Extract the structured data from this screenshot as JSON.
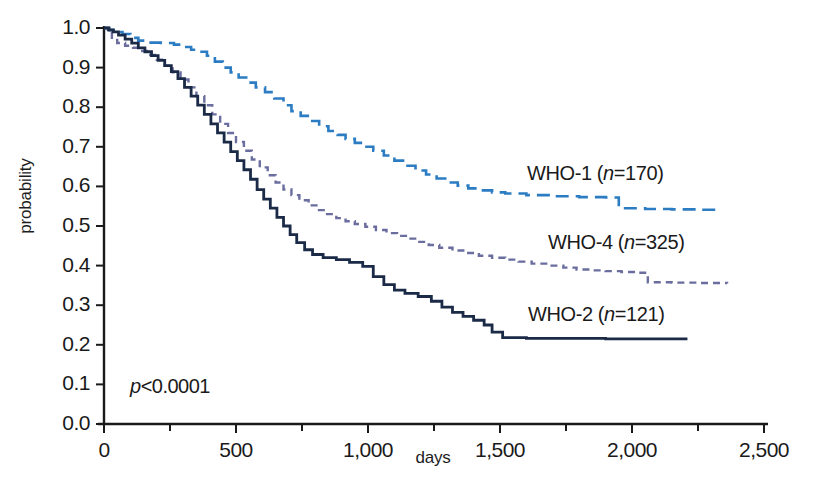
{
  "chart_data": {
    "type": "line",
    "subtype": "kaplan-meier-survival",
    "title": "",
    "xlabel": "days",
    "ylabel": "probability",
    "xlim": [
      0,
      2500
    ],
    "ylim": [
      0.0,
      1.0
    ],
    "grid": false,
    "legend_position": "inline-right",
    "xticks": [
      0,
      500,
      1000,
      1500,
      2000,
      2500
    ],
    "xtick_labels": [
      "0",
      "500",
      "1,000",
      "1,500",
      "2,000",
      "2,500"
    ],
    "xminor_step": 250,
    "yticks": [
      0.0,
      0.1,
      0.2,
      0.3,
      0.4,
      0.5,
      0.6,
      0.7,
      0.8,
      0.9,
      1.0
    ],
    "ytick_labels": [
      "0.0",
      "0.1",
      "0.2",
      "0.3",
      "0.4",
      "0.5",
      "0.6",
      "0.7",
      "0.8",
      "0.9",
      "1.0"
    ],
    "annotations": [
      {
        "name": "p-value",
        "text": "p<0.0001",
        "italic_prefix": "p",
        "rest": "<0.0001",
        "x": 110,
        "y": 0.12
      }
    ],
    "series": [
      {
        "name": "WHO-1",
        "label": "WHO-1",
        "n": 170,
        "legend_text": "WHO-1 (n=170)",
        "color": "#2b7cc2",
        "dash": "dashed",
        "width": 2.6,
        "final_probability": 0.54,
        "final_day": 2330,
        "points": [
          [
            0,
            1.0
          ],
          [
            20,
            0.995
          ],
          [
            45,
            0.99
          ],
          [
            70,
            0.985
          ],
          [
            100,
            0.975
          ],
          [
            130,
            0.968
          ],
          [
            170,
            0.963
          ],
          [
            215,
            0.962
          ],
          [
            265,
            0.958
          ],
          [
            300,
            0.952
          ],
          [
            330,
            0.945
          ],
          [
            360,
            0.94
          ],
          [
            390,
            0.93
          ],
          [
            420,
            0.915
          ],
          [
            450,
            0.9
          ],
          [
            480,
            0.888
          ],
          [
            510,
            0.875
          ],
          [
            545,
            0.862
          ],
          [
            575,
            0.85
          ],
          [
            610,
            0.838
          ],
          [
            645,
            0.822
          ],
          [
            680,
            0.805
          ],
          [
            710,
            0.79
          ],
          [
            745,
            0.778
          ],
          [
            780,
            0.765
          ],
          [
            815,
            0.752
          ],
          [
            850,
            0.74
          ],
          [
            885,
            0.73
          ],
          [
            915,
            0.72
          ],
          [
            950,
            0.71
          ],
          [
            985,
            0.7
          ],
          [
            1020,
            0.69
          ],
          [
            1060,
            0.678
          ],
          [
            1100,
            0.665
          ],
          [
            1140,
            0.652
          ],
          [
            1180,
            0.64
          ],
          [
            1220,
            0.63
          ],
          [
            1260,
            0.62
          ],
          [
            1300,
            0.61
          ],
          [
            1340,
            0.602
          ],
          [
            1380,
            0.595
          ],
          [
            1420,
            0.59
          ],
          [
            1470,
            0.585
          ],
          [
            1520,
            0.582
          ],
          [
            1600,
            0.578
          ],
          [
            1700,
            0.575
          ],
          [
            1800,
            0.573
          ],
          [
            1900,
            0.572
          ],
          [
            1950,
            0.545
          ],
          [
            2050,
            0.543
          ],
          [
            2150,
            0.542
          ],
          [
            2250,
            0.541
          ],
          [
            2330,
            0.54
          ]
        ]
      },
      {
        "name": "WHO-4",
        "label": "WHO-4",
        "n": 325,
        "legend_text": "WHO-4 (n=325)",
        "color": "#6a6d9e",
        "dash": "short-dashed",
        "width": 2.4,
        "final_probability": 0.355,
        "final_day": 2360,
        "points": [
          [
            0,
            1.0
          ],
          [
            15,
            0.99
          ],
          [
            30,
            0.975
          ],
          [
            50,
            0.962
          ],
          [
            80,
            0.955
          ],
          [
            110,
            0.95
          ],
          [
            140,
            0.942
          ],
          [
            170,
            0.932
          ],
          [
            200,
            0.92
          ],
          [
            230,
            0.905
          ],
          [
            260,
            0.888
          ],
          [
            290,
            0.87
          ],
          [
            320,
            0.85
          ],
          [
            350,
            0.828
          ],
          [
            380,
            0.805
          ],
          [
            410,
            0.782
          ],
          [
            440,
            0.758
          ],
          [
            470,
            0.735
          ],
          [
            500,
            0.712
          ],
          [
            530,
            0.69
          ],
          [
            560,
            0.668
          ],
          [
            590,
            0.648
          ],
          [
            620,
            0.628
          ],
          [
            650,
            0.61
          ],
          [
            680,
            0.592
          ],
          [
            710,
            0.578
          ],
          [
            740,
            0.565
          ],
          [
            775,
            0.552
          ],
          [
            810,
            0.54
          ],
          [
            845,
            0.53
          ],
          [
            880,
            0.52
          ],
          [
            915,
            0.512
          ],
          [
            950,
            0.505
          ],
          [
            990,
            0.498
          ],
          [
            1030,
            0.49
          ],
          [
            1070,
            0.482
          ],
          [
            1110,
            0.475
          ],
          [
            1150,
            0.468
          ],
          [
            1190,
            0.46
          ],
          [
            1230,
            0.452
          ],
          [
            1270,
            0.445
          ],
          [
            1320,
            0.438
          ],
          [
            1370,
            0.432
          ],
          [
            1420,
            0.425
          ],
          [
            1470,
            0.42
          ],
          [
            1520,
            0.415
          ],
          [
            1570,
            0.41
          ],
          [
            1620,
            0.405
          ],
          [
            1680,
            0.4
          ],
          [
            1740,
            0.395
          ],
          [
            1790,
            0.39
          ],
          [
            1840,
            0.388
          ],
          [
            1900,
            0.386
          ],
          [
            1960,
            0.384
          ],
          [
            2020,
            0.382
          ],
          [
            2060,
            0.358
          ],
          [
            2150,
            0.357
          ],
          [
            2250,
            0.356
          ],
          [
            2360,
            0.355
          ]
        ]
      },
      {
        "name": "WHO-2",
        "label": "WHO-2",
        "n": 121,
        "legend_text": "WHO-2 (n=121)",
        "color": "#1b2a४7",
        "dash": "solid",
        "width": 2.8,
        "final_probability": 0.215,
        "final_day": 2210,
        "points": [
          [
            0,
            1.0
          ],
          [
            18,
            0.995
          ],
          [
            35,
            0.99
          ],
          [
            55,
            0.982
          ],
          [
            80,
            0.972
          ],
          [
            105,
            0.962
          ],
          [
            130,
            0.95
          ],
          [
            155,
            0.94
          ],
          [
            180,
            0.93
          ],
          [
            205,
            0.918
          ],
          [
            230,
            0.905
          ],
          [
            255,
            0.89
          ],
          [
            280,
            0.872
          ],
          [
            305,
            0.85
          ],
          [
            330,
            0.828
          ],
          [
            355,
            0.805
          ],
          [
            380,
            0.782
          ],
          [
            405,
            0.758
          ],
          [
            430,
            0.735
          ],
          [
            455,
            0.712
          ],
          [
            480,
            0.688
          ],
          [
            505,
            0.665
          ],
          [
            530,
            0.642
          ],
          [
            555,
            0.618
          ],
          [
            580,
            0.592
          ],
          [
            605,
            0.568
          ],
          [
            630,
            0.545
          ],
          [
            655,
            0.522
          ],
          [
            680,
            0.5
          ],
          [
            705,
            0.478
          ],
          [
            730,
            0.458
          ],
          [
            760,
            0.44
          ],
          [
            790,
            0.428
          ],
          [
            830,
            0.42
          ],
          [
            880,
            0.415
          ],
          [
            930,
            0.408
          ],
          [
            980,
            0.398
          ],
          [
            1020,
            0.372
          ],
          [
            1060,
            0.352
          ],
          [
            1100,
            0.338
          ],
          [
            1140,
            0.33
          ],
          [
            1190,
            0.322
          ],
          [
            1240,
            0.31
          ],
          [
            1280,
            0.295
          ],
          [
            1320,
            0.282
          ],
          [
            1360,
            0.272
          ],
          [
            1400,
            0.262
          ],
          [
            1440,
            0.25
          ],
          [
            1470,
            0.232
          ],
          [
            1510,
            0.218
          ],
          [
            1600,
            0.216
          ],
          [
            1750,
            0.216
          ],
          [
            1900,
            0.215
          ],
          [
            2050,
            0.215
          ],
          [
            2210,
            0.215
          ]
        ]
      }
    ]
  },
  "axis": {
    "y_title": "probability",
    "x_title": "days"
  },
  "bottom_artifact": {
    "text": ""
  }
}
